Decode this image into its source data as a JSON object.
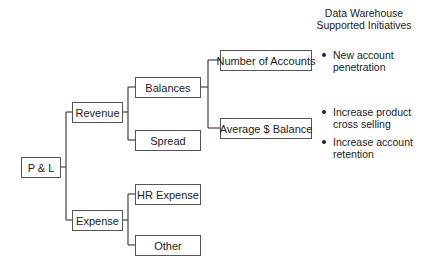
{
  "diagram": {
    "type": "tree",
    "root": {
      "label": "P & L",
      "children": [
        {
          "label": "Revenue",
          "children": [
            {
              "label": "Balances",
              "children": [
                {
                  "label": "Number of Accounts"
                },
                {
                  "label": "Average $ Balance"
                }
              ]
            },
            {
              "label": "Spread"
            }
          ]
        },
        {
          "label": "Expense",
          "children": [
            {
              "label": "HR Expense"
            },
            {
              "label": "Other"
            }
          ]
        }
      ]
    },
    "nodes": {
      "pl": "P & L",
      "revenue": "Revenue",
      "expense": "Expense",
      "balances": "Balances",
      "spread": "Spread",
      "hr_expense": "HR Expense",
      "other": "Other",
      "number_of_accounts": "Number of Accounts",
      "average_balance": "Average $ Balance"
    },
    "initiatives": {
      "header_line1": "Data Warehouse",
      "header_line2": "Supported Initiatives",
      "items": [
        {
          "line1": "New account",
          "line2": "penetration"
        },
        {
          "line1": "Increase product",
          "line2": "cross selling"
        },
        {
          "line1": "Increase account",
          "line2": "retention"
        }
      ]
    },
    "colors": {
      "line": "#444444",
      "box_border": "#555555",
      "text": "#222222",
      "background": "#ffffff"
    }
  }
}
